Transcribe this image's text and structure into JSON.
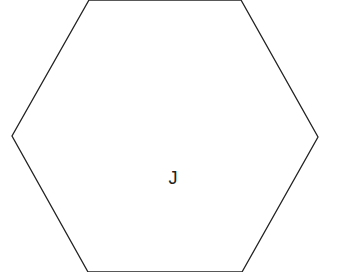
{
  "diagram": {
    "shape": "hexagon",
    "stroke_color": "#222222",
    "fill_color": "#ffffff",
    "label": "J",
    "vertices": [
      [
        89,
        0
      ],
      [
        241,
        0
      ],
      [
        318,
        137
      ],
      [
        242,
        272
      ],
      [
        88,
        272
      ],
      [
        12,
        136
      ]
    ]
  }
}
